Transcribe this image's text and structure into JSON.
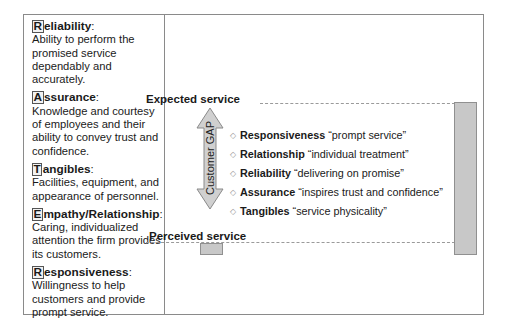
{
  "dimensions": [
    {
      "first": "R",
      "rest": "eliability",
      "desc": "Ability to perform the promised service dependably and accurately."
    },
    {
      "first": "A",
      "rest": "ssurance",
      "desc": "Knowledge and courtesy of employees and their ability to convey trust and confidence."
    },
    {
      "first": "T",
      "rest": "angibles",
      "desc": "Facilities, equipment, and appearance of personnel."
    },
    {
      "first": "E",
      "rest": "mpathy/Relationship",
      "desc": "Caring, individualized attention the firm provides its customers."
    },
    {
      "first": "R",
      "rest": "esponsiveness",
      "desc": "Willingness to help customers and provide prompt service."
    }
  ],
  "colon": ":",
  "gap_diagram": {
    "expected_label": "Expected service",
    "perceived_label": "Perceived service",
    "arrow_label": "Customer GAP",
    "items": [
      {
        "term": "Responsiveness",
        "quote": "“prompt service”"
      },
      {
        "term": "Relationship",
        "quote": "“individual treatment”"
      },
      {
        "term": "Reliability",
        "quote": "“delivering on promise”"
      },
      {
        "term": "Assurance",
        "quote": "“inspires trust and confidence”"
      },
      {
        "term": "Tangibles",
        "quote": "“service physicality”"
      }
    ],
    "bullet": "◇"
  },
  "colors": {
    "bar_fill": "#c8c8c8",
    "frame": "#8a8a8a"
  }
}
